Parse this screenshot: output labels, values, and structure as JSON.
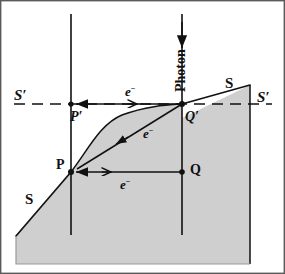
{
  "figure": {
    "background_color": "#ffffff",
    "border_color": "#5a5a5a",
    "shaded_region_fill": "#cfcfcf",
    "shaded_region_stroke": "#111111",
    "line_color": "#111111",
    "dashed_line_color": "#111111"
  },
  "labels": {
    "surface_left": "S",
    "surface_right": "S",
    "reference_left": "S′",
    "reference_right": "S′",
    "point_p": "P",
    "point_p_prime": "P′",
    "point_q": "Q",
    "point_q_prime": "Q′",
    "photon": "Photon",
    "electron_top": "e",
    "electron_top_charge": "−",
    "electron_diagonal": "e",
    "electron_diagonal_charge": "−",
    "electron_bottom": "e",
    "electron_bottom_charge": "−"
  },
  "geometry": {
    "point_p": [
      71,
      172
    ],
    "point_p_prime": [
      71,
      104
    ],
    "point_q": [
      182,
      172
    ],
    "point_q_prime": [
      182,
      104
    ],
    "left_vertical_line": {
      "x": 71,
      "y_top": 14,
      "y_bottom": 235
    },
    "right_vertical_line": {
      "x": 182,
      "y_top": 14,
      "y_bottom": 235
    },
    "dashed_reference_line": {
      "y": 104,
      "x_start": 14,
      "x_end": 272
    },
    "photon_arrow": {
      "x": 182,
      "y_start": 14,
      "y_end": 50
    },
    "electron_top_arrow": {
      "y": 104,
      "x_start": 182,
      "x_end": 74
    },
    "electron_bottom_arrow": {
      "y": 172,
      "x_start": 182,
      "x_end": 74
    },
    "electron_diagonal_arrow": {
      "from": [
        182,
        104
      ],
      "to": [
        74,
        170
      ]
    },
    "shaded_polygon": "16,235 16,264 250,264 250,85 71,172",
    "surface_curve": "P to Q-prime concave rise"
  }
}
